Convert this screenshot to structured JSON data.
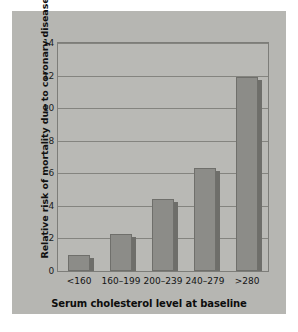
{
  "chart_data": {
    "type": "bar",
    "title": "",
    "xlabel": "Serum cholesterol level at baseline",
    "ylabel": "Relative risk of mortality due to coronary disease",
    "categories": [
      "<160",
      "160–199",
      "200–239",
      "240–279",
      ">280"
    ],
    "values": [
      1.0,
      2.3,
      4.4,
      6.3,
      11.9
    ],
    "ylim": [
      0,
      14
    ],
    "yticks": [
      0,
      2,
      4,
      6,
      8,
      10,
      12,
      14
    ],
    "ytick_labels": [
      "0",
      "2",
      "4",
      "6",
      "8",
      "10",
      "12",
      "14"
    ],
    "grid": true,
    "legend": false,
    "bar_color": "#8c8c88",
    "plot_background": "#b9b9b5",
    "figure_background": "#b6b6b2",
    "page_background": "#ffffff",
    "axis_color": "#7d7d79"
  }
}
